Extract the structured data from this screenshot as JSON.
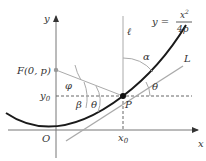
{
  "diagram": {
    "axes": {
      "x_label": "x",
      "y_label": "y",
      "origin_label": "O"
    },
    "equation": {
      "lhs": "y =",
      "numerator": "x",
      "exponent": "2",
      "denominator": "4p"
    },
    "focus_label": "F(0, p)",
    "point_label": "P",
    "x0_label": "x",
    "x0_sub": "0",
    "y0_label": "y",
    "y0_sub": "0",
    "vertical_line_label": "ℓ",
    "tangent_label": "L",
    "angles": {
      "alpha": "α",
      "beta": "β",
      "phi": "φ",
      "theta": "θ"
    },
    "colors": {
      "curve": "#1a1a1a",
      "lines": "#999999",
      "axes": "#555555",
      "point": "#111111"
    }
  }
}
